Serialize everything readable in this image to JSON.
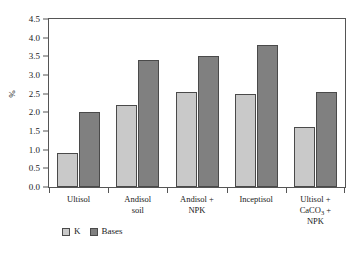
{
  "chart_data": {
    "type": "bar",
    "title": "",
    "subtitle": "",
    "xlabel": "",
    "ylabel": "%",
    "ylim": [
      0.0,
      4.5
    ],
    "ytick_labels": [
      "0.0",
      "0.5",
      "1.0",
      "1.5",
      "2.0",
      "2.5",
      "3.0",
      "3.5",
      "4.0",
      "4.5"
    ],
    "ytick_values": [
      0.0,
      0.5,
      1.0,
      1.5,
      2.0,
      2.5,
      3.0,
      3.5,
      4.0,
      4.5
    ],
    "grid": false,
    "legend_position": "bottom-left",
    "categories": [
      "Ultisol",
      "Andisol soil",
      "Andisol + NPK",
      "Inceptisol",
      "Ultisol + CaCO3 + NPK"
    ],
    "category_lines": [
      [
        "Ultisol"
      ],
      [
        "Andisol",
        "soil"
      ],
      [
        "Andisol +",
        "NPK"
      ],
      [
        "Inceptisol"
      ],
      [
        "Ultisol +",
        "CaCO#3# +",
        "NPK"
      ]
    ],
    "series": [
      {
        "name": "K",
        "color": "#c9c9c9",
        "values": [
          0.9,
          2.2,
          2.55,
          2.5,
          1.6
        ]
      },
      {
        "name": "Bases",
        "color": "#808080",
        "values": [
          2.0,
          3.4,
          3.5,
          3.8,
          2.55
        ]
      }
    ]
  },
  "legend": {
    "items": [
      {
        "label": "K",
        "color": "#c9c9c9"
      },
      {
        "label": "Bases",
        "color": "#808080"
      }
    ]
  },
  "colors": {
    "k_series": "#c9c9c9",
    "bases_series": "#808080",
    "axis": "#555555",
    "text": "#1a1a1a",
    "background": "#ffffff"
  }
}
